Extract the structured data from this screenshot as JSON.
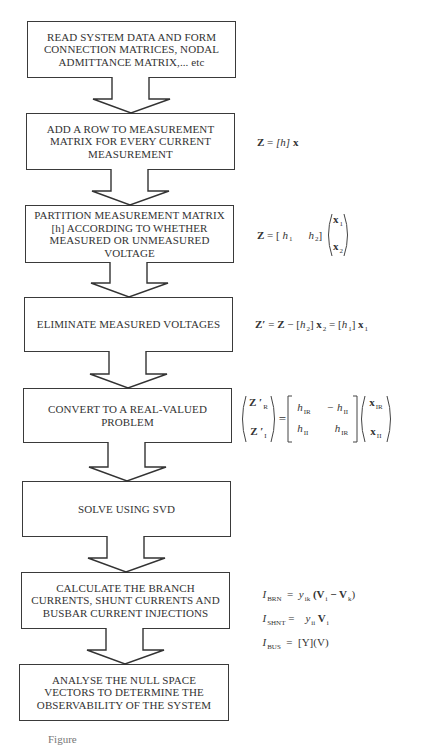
{
  "flowchart": {
    "boxes": [
      {
        "id": "read-system-data",
        "text": "READ SYSTEM DATA AND FORM\nCONNECTION MATRICES, NODAL\nADMITTANCE MATRIX,... etc"
      },
      {
        "id": "add-row",
        "text": "ADD A ROW TO MEASUREMENT\nMATRIX FOR EVERY CURRENT\nMEASUREMENT"
      },
      {
        "id": "partition",
        "text": "PARTITION MEASUREMENT MATRIX\n[h] ACCORDING TO WHETHER\nMEASURED OR UNMEASURED\nVOLTAGE"
      },
      {
        "id": "eliminate",
        "text": "ELIMINATE MEASURED VOLTAGES"
      },
      {
        "id": "convert",
        "text": "CONVERT TO A REAL-VALUED\nPROBLEM"
      },
      {
        "id": "solve",
        "text": "SOLVE USING SVD"
      },
      {
        "id": "calculate",
        "text": "CALCULATE THE BRANCH\nCURRENTS, SHUNT CURRENTS AND\nBUSBAR CURRENT INJECTIONS"
      },
      {
        "id": "analyse",
        "text": "ANALYSE THE NULL SPACE\nVECTORS TO DETERMINE THE\nOBSERVABILITY OF THE SYSTEM"
      }
    ],
    "arrow_count": 7
  },
  "formulas": {
    "f1": {
      "lhs": "Z",
      "eq": " = ",
      "rhs_h": "[h]",
      "rhs_x": " x"
    },
    "f2": {
      "lhs": "Z",
      "eq": " = ",
      "h1": "h",
      "h1_sub": "1",
      "h2": "h",
      "h2_sub": "2",
      "x1": "x",
      "x1_sub": "1",
      "x2": "x",
      "x2_sub": "2"
    },
    "f3": {
      "lhs": "Z′",
      "eq": " = ",
      "z": "Z",
      "minus": " − [",
      "h2": "h",
      "h2_sub": "2",
      "close": "] ",
      "x2": "x",
      "x2_sub": "2",
      "eq2": " = [",
      "h1": "h",
      "h1_sub": "1",
      "close2": "] ",
      "x1": "x",
      "x1_sub": "1"
    },
    "f4": {
      "z_r": "Z ′",
      "z_r_sub": "R",
      "z_i": "Z ′",
      "z_i_sub": "I",
      "eq": "=",
      "m11": "h",
      "m11_sub": "IR",
      "m12": "− h",
      "m12_sub": "II",
      "m21": "h",
      "m21_sub": "II",
      "m22": "h",
      "m22_sub": "IR",
      "x_r": "x",
      "x_r_sub": "IR",
      "x_i": "x",
      "x_i_sub": "II"
    },
    "f5": [
      {
        "lhs": "I",
        "lhs_sub": "BRN",
        "eq": "  =  ",
        "y": "y",
        "y_sub": "ik",
        "rhs": " (V",
        "v1_sub": "i",
        "mid": " − V",
        "v2_sub": "k",
        "end": ")"
      },
      {
        "lhs": "I",
        "lhs_sub": "SHNT",
        "eq": " =    ",
        "y": "y",
        "y_sub": "ii",
        "rhs": " V",
        "v1_sub": "i"
      },
      {
        "lhs": "I",
        "lhs_sub": "BUS",
        "eq": "  =  ",
        "rhs": "[Y](V)"
      }
    ]
  },
  "caption": "Figure"
}
